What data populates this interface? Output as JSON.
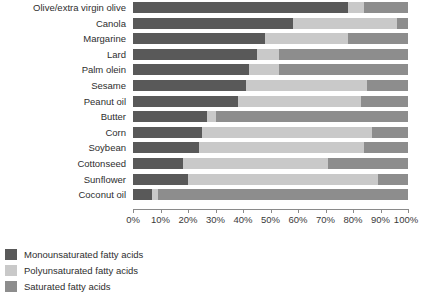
{
  "chart_data": {
    "type": "bar",
    "orientation": "horizontal",
    "stacked": true,
    "normalized": true,
    "title": "",
    "subtitle": "",
    "xlabel": "",
    "ylabel": "",
    "xlim": [
      0,
      100
    ],
    "grid": false,
    "legend_position": "bottom-left",
    "xtick_labels": [
      "0%",
      "10%",
      "20%",
      "30%",
      "40%",
      "50%",
      "60%",
      "70%",
      "80%",
      "90%",
      "100%"
    ],
    "xticks": [
      0,
      10,
      20,
      30,
      40,
      50,
      60,
      70,
      80,
      90,
      100
    ],
    "categories": [
      "Olive/extra virgin olive",
      "Canola",
      "Margarine",
      "Lard",
      "Palm olein",
      "Sesame",
      "Peanut oil",
      "Butter",
      "Corn",
      "Soybean",
      "Cottonseed",
      "Sunflower",
      "Coconut oil"
    ],
    "series": [
      {
        "name": "Monounsaturated fatty acids",
        "color": "#595959",
        "values": [
          78,
          58,
          48,
          45,
          42,
          41,
          38,
          27,
          25,
          24,
          18,
          20,
          7
        ]
      },
      {
        "name": "Polyunsaturated fatty acids",
        "color": "#c9c9c9",
        "values": [
          6,
          38,
          30,
          8,
          11,
          44,
          45,
          3,
          62,
          60,
          53,
          69,
          2
        ]
      },
      {
        "name": "Saturated fatty acids",
        "color": "#8d8d8d",
        "values": [
          16,
          4,
          22,
          47,
          47,
          15,
          17,
          70,
          13,
          16,
          29,
          11,
          91
        ]
      }
    ]
  },
  "legend": {
    "items": [
      {
        "label": "Monounsaturated fatty acids",
        "color": "#595959"
      },
      {
        "label": "Polyunsaturated fatty acids",
        "color": "#c9c9c9"
      },
      {
        "label": "Saturated fatty acids",
        "color": "#8d8d8d"
      }
    ]
  }
}
